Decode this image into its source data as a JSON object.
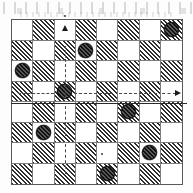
{
  "figure": {
    "kind": "checkerboard-diagram",
    "title": "",
    "board": {
      "rows": 8,
      "cols": 8,
      "dark_square_rule": "(row+col) odd",
      "dark_square_fill": "diagonal-hatch",
      "light_square_fill": "#ffffff",
      "border_color": "#5a5a5a",
      "grid_line_color": "#7d7d7d"
    },
    "pieces": [
      {
        "name": "piece-r0c7",
        "row": 0,
        "col": 7,
        "color": "#4a4a4a"
      },
      {
        "name": "piece-r1c3",
        "row": 1,
        "col": 3,
        "color": "#4a4a4a"
      },
      {
        "name": "piece-r2c0",
        "row": 2,
        "col": 0,
        "color": "#4a4a4a"
      },
      {
        "name": "piece-r3c2",
        "row": 3,
        "col": 2,
        "color": "#4a4a4a"
      },
      {
        "name": "piece-r4c5",
        "row": 4,
        "col": 5,
        "color": "#4a4a4a"
      },
      {
        "name": "piece-r5c1",
        "row": 5,
        "col": 1,
        "color": "#4a4a4a"
      },
      {
        "name": "piece-r6c6",
        "row": 6,
        "col": 6,
        "color": "#4a4a4a"
      },
      {
        "name": "piece-r7c4",
        "row": 7,
        "col": 4,
        "color": "#4a4a4a"
      }
    ],
    "markers": {
      "up_arrow": {
        "label": "up-arrow",
        "col": 2,
        "row": 0
      },
      "right_arrow": {
        "label": "right-arrow",
        "col": 7,
        "row": 3
      },
      "vertical_dashed_line": {
        "label": "vertical-dashed-guide",
        "col": 2,
        "from_row": 0,
        "to_row": 6
      },
      "horizontal_dashed_line": {
        "label": "horizontal-dashed-guide",
        "row": 3,
        "from_col": 0,
        "to_col": 7
      },
      "solid_rule": {
        "label": "solid-horizontal-rule",
        "row_boundary": 4
      },
      "center_dot": {
        "label": "center-dot",
        "row": 5,
        "col": 3
      },
      "top_dot": {
        "label": "top-tick-dot",
        "row": -1,
        "col": 2
      }
    },
    "colors": {
      "ink": "#1a1a1a",
      "hatch_dark": "#2e2e2e",
      "paper": "#ffffff",
      "piece_fill": "#4a4a4a"
    }
  }
}
